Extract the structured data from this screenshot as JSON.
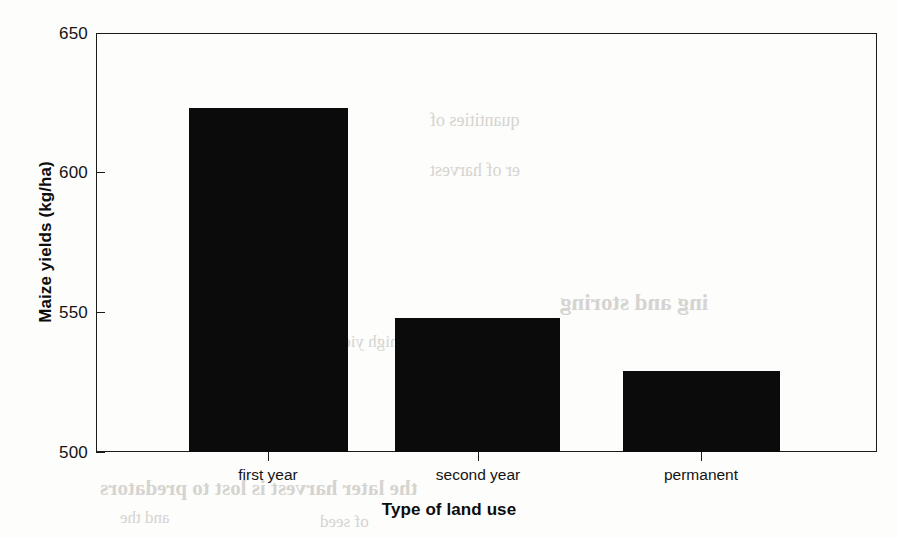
{
  "chart_data": {
    "type": "bar",
    "title": "",
    "categories": [
      "first year",
      "second year",
      "permanent"
    ],
    "values": [
      623,
      548,
      529
    ],
    "xlabel": "Type of land use",
    "ylabel": "Maize yields (kg/ha)",
    "ylim": [
      500,
      650
    ],
    "yticks": [
      500,
      550,
      600,
      650
    ],
    "ytick_labels": [
      "500",
      "550",
      "600",
      "650"
    ],
    "grid": false,
    "legend": null,
    "bar_color": "#0b0b0b",
    "axis_color": "#1a1a1a",
    "series": [
      {
        "name": "Maize yields (kg/ha)",
        "values": [
          623,
          548,
          529
        ]
      }
    ]
  },
  "axes": {
    "y_title": "Maize yields (kg/ha)",
    "x_title": "Type of land use",
    "y_tick_0": "500",
    "y_tick_1": "550",
    "y_tick_2": "600",
    "y_tick_3": "650",
    "x_tick_0": "first year",
    "x_tick_1": "second year",
    "x_tick_2": "permanent"
  },
  "artifacts": {
    "bleed_1": "ing and storing",
    "bleed_2": "quantities of",
    "bleed_3": "er of harvest",
    "bleed_4": "the later harvest is lost to predators",
    "bleed_5": "a high yield",
    "bleed_6": "and the",
    "bleed_7": "of seed"
  }
}
